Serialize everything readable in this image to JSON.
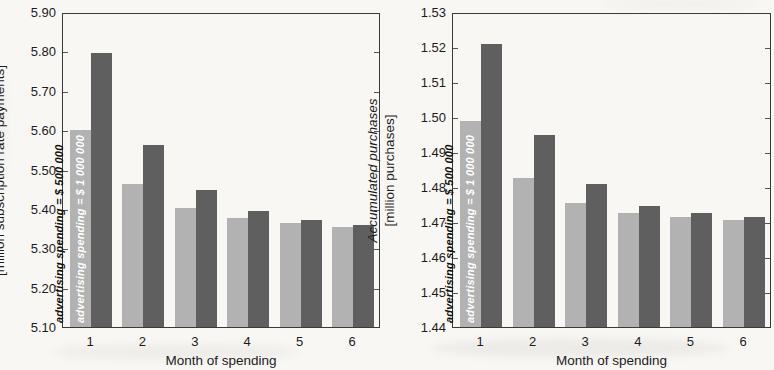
{
  "colors": {
    "background": "#f8f7f4",
    "bar_light": "#b2b2b2",
    "bar_dark": "#5f5f5f",
    "axis": "#3a3a3a",
    "text": "#1c1c1c",
    "label_on_light": "#111111",
    "label_on_dark": "#ffffff"
  },
  "chart_data": [
    {
      "type": "bar",
      "title": "",
      "xlabel": "Month of spending",
      "ylabel": "Accumulated customer-months",
      "ylabel_units": "[million subscription rate payments]",
      "categories": [
        "1",
        "2",
        "3",
        "4",
        "5",
        "6"
      ],
      "ylim": [
        5.1,
        5.9
      ],
      "ytick_step": 0.1,
      "yticks": [
        "5.90",
        "5.80",
        "5.70",
        "5.60",
        "5.50",
        "5.40",
        "5.30",
        "5.20",
        "5.10"
      ],
      "grid": false,
      "legend_position": "labels-inside-month-1-bars",
      "series": [
        {
          "name": "advertising spending = $ 500 000",
          "shade": "light",
          "values": [
            5.6,
            5.462,
            5.403,
            5.376,
            5.364,
            5.355
          ]
        },
        {
          "name": "advertising spending = $ 1 000 000",
          "shade": "dark",
          "values": [
            5.795,
            5.562,
            5.447,
            5.394,
            5.372,
            5.359
          ]
        }
      ]
    },
    {
      "type": "bar",
      "title": "",
      "xlabel": "Month of spending",
      "ylabel": "Accumulated purchases",
      "ylabel_units": "[million purchases]",
      "categories": [
        "1",
        "2",
        "3",
        "4",
        "5",
        "6"
      ],
      "ylim": [
        1.44,
        1.53
      ],
      "ytick_step": 0.01,
      "yticks": [
        "1.53",
        "1.52",
        "1.51",
        "1.50",
        "1.49",
        "1.48",
        "1.47",
        "1.46",
        "1.45",
        "1.44"
      ],
      "grid": false,
      "legend_position": "labels-inside-month-1-bars",
      "series": [
        {
          "name": "advertising spending = $ 500 000",
          "shade": "light",
          "values": [
            1.499,
            1.4825,
            1.4755,
            1.4725,
            1.4715,
            1.4705
          ]
        },
        {
          "name": "advertising spending = $ 1 000 000",
          "shade": "dark",
          "values": [
            1.521,
            1.495,
            1.481,
            1.4745,
            1.4725,
            1.4715
          ]
        }
      ]
    }
  ]
}
